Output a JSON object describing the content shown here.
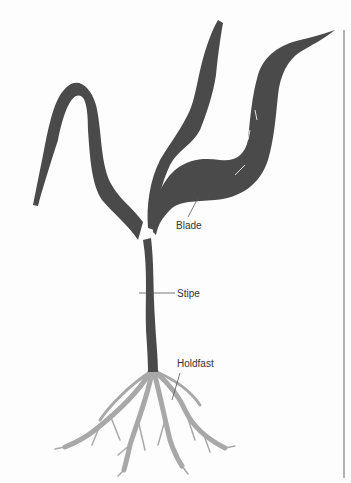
{
  "diagram": {
    "labels": [
      {
        "id": "blade",
        "text": "Blade"
      },
      {
        "id": "stipe",
        "text": "Stipe"
      },
      {
        "id": "holdfast",
        "text": "Holdfast"
      }
    ]
  },
  "colors": {
    "thallus": "#4a4a4a",
    "holdfast": "#a8a8a8",
    "leader": "#555555",
    "margin_rule": "#8c8c8c",
    "background": "#fdfdfd"
  }
}
